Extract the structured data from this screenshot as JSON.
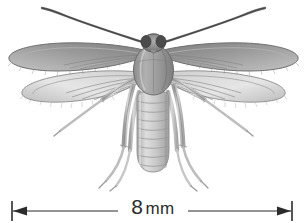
{
  "figure": {
    "common_name": "fungus gnat",
    "style": "grayscale scientific illustration",
    "background_color": "#ffffff"
  },
  "scale_bar": {
    "value": "8",
    "unit": "mm",
    "full_label": "8 mm",
    "left_arrow_icon": "arrow-left-icon",
    "right_arrow_icon": "arrow-right-icon",
    "line_color": "#2b2b2b",
    "x_start_px": 12,
    "x_end_px": 292,
    "y_px": 211
  },
  "anatomy": {
    "antennae": {
      "count": 2,
      "label": "antenna"
    },
    "head": {
      "label": "head",
      "eye_count": 2,
      "eye_color": "#4a4a4a"
    },
    "thorax": {
      "label": "thorax",
      "fill_color": "#9a9a9a"
    },
    "abdomen": {
      "label": "abdomen",
      "segment_count": 8,
      "fill_color": "#c8c8c8"
    },
    "forewings": {
      "count": 2,
      "label": "forewing",
      "fill_color": "#8e8e8e"
    },
    "hindwings": {
      "count": 2,
      "label": "hindwing",
      "fill_color": "#dcdcdc"
    },
    "legs": {
      "count": 6,
      "label": "leg",
      "fill_color": "#b5b5b5"
    }
  },
  "colors": {
    "ink": "#2b2b2b",
    "mid_gray": "#8e8e8e",
    "light_gray": "#d2d2d2",
    "dark_gray": "#5a5a5a",
    "white": "#ffffff"
  }
}
